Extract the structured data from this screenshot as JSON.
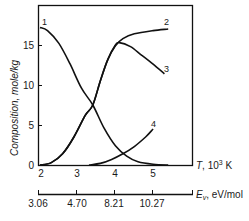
{
  "chart_data": {
    "type": "line",
    "title": "",
    "xlabel": "T, 10³ K",
    "ylabel": "Composition, mole/kg",
    "xlim": [
      2,
      5.7
    ],
    "ylim": [
      0,
      20
    ],
    "grid": false,
    "legend": "inline curve numbers",
    "x_ticks": [
      2,
      3,
      4,
      5
    ],
    "y_ticks": [
      0,
      5,
      10,
      15
    ],
    "secondary_x_axis": {
      "label": "E_v, eV/mol",
      "ticks_at_T": [
        2,
        3,
        4,
        5
      ],
      "tick_labels": [
        "3.06",
        "4.70",
        "8.21",
        "10.27"
      ]
    },
    "series": [
      {
        "name": "1",
        "x": [
          2.0,
          2.2,
          2.5,
          2.8,
          3.1,
          3.4,
          3.7,
          4.0,
          4.3,
          4.6,
          5.0,
          5.4
        ],
        "values": [
          17.2,
          16.8,
          15.2,
          12.6,
          9.6,
          7.5,
          4.6,
          2.4,
          1.1,
          0.4,
          0.1,
          0.0
        ]
      },
      {
        "name": "2",
        "x": [
          2.0,
          2.3,
          2.6,
          2.9,
          3.2,
          3.4,
          3.6,
          3.8,
          4.0,
          4.2,
          4.5,
          5.0,
          5.4
        ],
        "values": [
          0.0,
          0.3,
          1.4,
          3.5,
          6.2,
          7.5,
          10.5,
          13.2,
          14.9,
          15.8,
          16.4,
          16.8,
          17.0
        ]
      },
      {
        "name": "3",
        "x": [
          2.0,
          2.3,
          2.6,
          2.9,
          3.2,
          3.4,
          3.6,
          3.8,
          4.0,
          4.1,
          4.4,
          4.7,
          5.0,
          5.3
        ],
        "values": [
          0.0,
          0.3,
          1.4,
          3.5,
          6.2,
          7.5,
          10.5,
          13.2,
          15.0,
          15.3,
          14.8,
          13.7,
          12.6,
          11.4
        ]
      },
      {
        "name": "4",
        "x": [
          3.3,
          3.6,
          3.9,
          4.2,
          4.5,
          4.8,
          5.0
        ],
        "values": [
          0.0,
          0.2,
          0.7,
          1.4,
          2.3,
          3.5,
          4.5
        ]
      }
    ]
  },
  "labels": {
    "y_axis_title": "Composition, mole/kg",
    "x_axis_title_italic": "T",
    "x_axis_title_rest": ", 10",
    "x_axis_title_sup": "3",
    "x_axis_title_unit": " K",
    "e_axis_title_italic": "E",
    "e_axis_title_sub": "v",
    "e_axis_title_rest": ", eV/mol",
    "y_ticks": [
      "0",
      "5",
      "10",
      "15"
    ],
    "x_ticks": [
      "2",
      "3",
      "4",
      "5"
    ],
    "e_ticks": [
      "3.06",
      "4.70",
      "8.21",
      "10.27"
    ],
    "curves": [
      "1",
      "2",
      "3",
      "4"
    ]
  }
}
